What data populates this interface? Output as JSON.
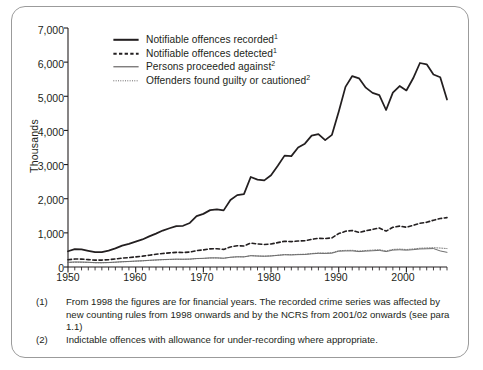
{
  "chart_data": {
    "type": "line",
    "title": "",
    "xlabel": "",
    "ylabel": "Thousands",
    "xlim": [
      1950,
      2006
    ],
    "ylim": [
      0,
      7000
    ],
    "ytick_labels": [
      "7,000",
      "6,000",
      "5,000",
      "4,000",
      "3,000",
      "2,000",
      "1,000",
      "0"
    ],
    "ytick_values": [
      7000,
      6000,
      5000,
      4000,
      3000,
      2000,
      1000,
      0
    ],
    "xtick_labels": [
      "1950",
      "1960",
      "1970",
      "1980",
      "1990",
      "2000"
    ],
    "xtick_values": [
      1950,
      1960,
      1970,
      1980,
      1990,
      2000
    ],
    "minor_ticks": "annual",
    "grid": false,
    "legend_position": "top-left-inside",
    "x": [
      1950,
      1951,
      1952,
      1953,
      1954,
      1955,
      1956,
      1957,
      1958,
      1959,
      1960,
      1961,
      1962,
      1963,
      1964,
      1965,
      1966,
      1967,
      1968,
      1969,
      1970,
      1971,
      1972,
      1973,
      1974,
      1975,
      1976,
      1977,
      1978,
      1979,
      1980,
      1981,
      1982,
      1983,
      1984,
      1985,
      1986,
      1987,
      1988,
      1989,
      1990,
      1991,
      1992,
      1993,
      1994,
      1995,
      1996,
      1997,
      1998,
      1999,
      2000,
      2001,
      2002,
      2003,
      2004,
      2005,
      2006
    ],
    "series": [
      {
        "name": "Notifiable offences recorded",
        "footnote": "1",
        "style": "thick-solid",
        "values": [
          461,
          525,
          513,
          472,
          435,
          438,
          479,
          546,
          626,
          675,
          743,
          807,
          896,
          978,
          1067,
          1134,
          1199,
          1208,
          1289,
          1488,
          1556,
          1666,
          1690,
          1658,
          1963,
          2106,
          2136,
          2636,
          2561,
          2537,
          2688,
          2964,
          3262,
          3247,
          3499,
          3612,
          3847,
          3892,
          3716,
          3870,
          4544,
          5276,
          5592,
          5526,
          5253,
          5100,
          5036,
          4598,
          5109,
          5301,
          5171,
          5527,
          5975,
          5935,
          5638,
          5556,
          4905
        ]
      },
      {
        "name": "Notifiable offences detected",
        "footnote": "1",
        "style": "bold-dashed",
        "values": [
          213,
          233,
          231,
          217,
          201,
          202,
          214,
          234,
          260,
          274,
          296,
          318,
          345,
          372,
          396,
          414,
          429,
          426,
          437,
          480,
          500,
          532,
          536,
          516,
          588,
          621,
          616,
          700,
          673,
          660,
          675,
          714,
          753,
          742,
          760,
          768,
          809,
          841,
          832,
          853,
          979,
          1047,
          1067,
          1012,
          1060,
          1100,
          1143,
          1050,
          1163,
          1198,
          1165,
          1218,
          1280,
          1310,
          1370,
          1420,
          1445
        ]
      },
      {
        "name": "Persons proceeded against",
        "footnote": "2",
        "style": "thin-solid",
        "values": [
          137,
          147,
          145,
          139,
          128,
          127,
          132,
          143,
          155,
          163,
          174,
          183,
          196,
          207,
          217,
          224,
          230,
          228,
          232,
          248,
          254,
          267,
          267,
          257,
          285,
          299,
          297,
          331,
          321,
          315,
          323,
          341,
          358,
          353,
          362,
          366,
          385,
          400,
          396,
          405,
          462,
          470,
          472,
          451,
          465,
          476,
          487,
          451,
          495,
          505,
          492,
          508,
          528,
          534,
          540,
          470,
          430
        ]
      },
      {
        "name": "Offenders found guilty or cautioned",
        "footnote": "2",
        "style": "fine-dotted",
        "values": [
          131,
          141,
          140,
          134,
          124,
          123,
          128,
          139,
          151,
          159,
          170,
          179,
          192,
          203,
          213,
          220,
          226,
          225,
          229,
          245,
          251,
          264,
          265,
          256,
          284,
          298,
          297,
          332,
          323,
          318,
          327,
          346,
          364,
          360,
          370,
          375,
          395,
          411,
          408,
          418,
          477,
          486,
          489,
          468,
          483,
          495,
          507,
          470,
          515,
          525,
          512,
          529,
          550,
          557,
          565,
          555,
          540
        ]
      }
    ]
  },
  "legend": {
    "items": [
      {
        "label": "Notifiable offences recorded",
        "sup": "1",
        "key": "thick-solid"
      },
      {
        "label": "Notifiable offences detected",
        "sup": "1",
        "key": "bold-dashed"
      },
      {
        "label": "Persons proceeded against",
        "sup": "2",
        "key": "thin-solid"
      },
      {
        "label": "Offenders found guilty or cautioned",
        "sup": "2",
        "key": "fine-dotted"
      }
    ]
  },
  "footnotes": [
    {
      "marker": "(1)",
      "text": "From 1998 the figures are for financial years. The recorded crime series was affected by new counting rules from 1998 onwards and by the NCRS from 2001/02 onwards (see para 1.1)"
    },
    {
      "marker": "(2)",
      "text": "Indictable offences with allowance for under-recording where appropriate."
    }
  ],
  "colors": {
    "axis": "#231f20",
    "border": "#9b9b9b",
    "line_primary": "#231f20",
    "line_secondary": "#3a3a3a",
    "background": "#ffffff"
  }
}
